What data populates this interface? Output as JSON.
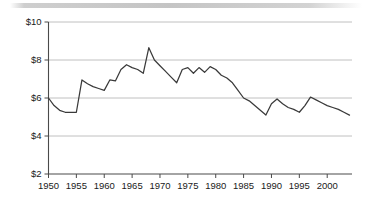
{
  "figure": {
    "background_color": "#ffffff",
    "line_color": "#3a3a3a",
    "grid_color": "#b9b9b9",
    "axis_color": "#4a4a4a",
    "top_band_note": "scan-artifact-band"
  },
  "chart_data": {
    "type": "line",
    "title": "",
    "subtitle": "",
    "xlabel": "",
    "ylabel": "",
    "xlim": [
      1950,
      2004
    ],
    "ylim": [
      2,
      10
    ],
    "grid": "horizontal",
    "legend": "none",
    "y_tick_labels": [
      "$10",
      "$8",
      "$6",
      "$4",
      "$2"
    ],
    "y_tick_values": [
      10,
      8,
      6,
      4,
      2
    ],
    "x_tick_labels": [
      "1950",
      "1955",
      "1960",
      "1965",
      "1970",
      "1975",
      "1980",
      "1985",
      "1990",
      "1995",
      "2000"
    ],
    "x_tick_values": [
      1950,
      1955,
      1960,
      1965,
      1970,
      1975,
      1980,
      1985,
      1990,
      1995,
      2000
    ],
    "series": [
      {
        "name": "value",
        "x": [
          1950,
          1951,
          1952,
          1953,
          1954,
          1955,
          1956,
          1957,
          1958,
          1959,
          1960,
          1961,
          1962,
          1963,
          1964,
          1965,
          1966,
          1967,
          1968,
          1969,
          1970,
          1971,
          1972,
          1973,
          1974,
          1975,
          1976,
          1977,
          1978,
          1979,
          1980,
          1981,
          1982,
          1983,
          1984,
          1985,
          1986,
          1987,
          1988,
          1989,
          1990,
          1991,
          1992,
          1993,
          1994,
          1995,
          1996,
          1997,
          1998,
          1999,
          2000,
          2001,
          2002,
          2003,
          2004
        ],
        "values": [
          6.0,
          5.6,
          5.35,
          5.25,
          5.25,
          5.25,
          6.95,
          6.75,
          6.6,
          6.5,
          6.4,
          6.95,
          6.9,
          7.5,
          7.75,
          7.6,
          7.5,
          7.3,
          8.65,
          8.0,
          7.7,
          7.4,
          7.1,
          6.8,
          7.5,
          7.6,
          7.3,
          7.6,
          7.35,
          7.65,
          7.5,
          7.2,
          7.05,
          6.8,
          6.4,
          6.0,
          5.85,
          5.6,
          5.35,
          5.1,
          5.7,
          5.95,
          5.7,
          5.5,
          5.4,
          5.25,
          5.6,
          6.05,
          5.9,
          5.75,
          5.6,
          5.5,
          5.4,
          5.25,
          5.1
        ]
      }
    ]
  }
}
